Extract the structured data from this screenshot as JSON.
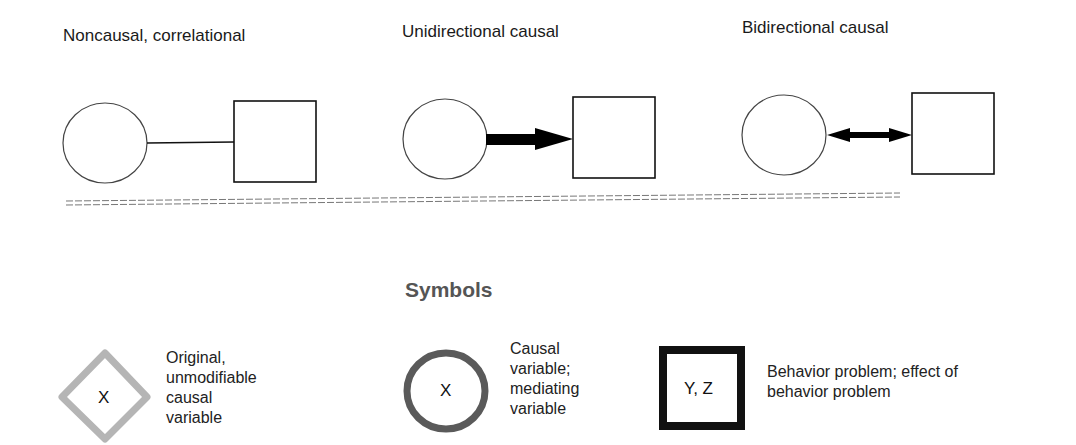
{
  "panels": [
    {
      "title": "Noncausal, correlational",
      "relation": "line"
    },
    {
      "title": "Unidirectional causal",
      "relation": "unidirectional-arrow"
    },
    {
      "title": "Bidirectional causal",
      "relation": "bidirectional-arrow"
    }
  ],
  "symbols": {
    "heading": "Symbols",
    "items": [
      {
        "shape": "diamond",
        "glyph": "X",
        "line1": "Original,",
        "line2": "unmodifiable",
        "line3": "causal",
        "line4": "variable",
        "stroke": "#b5b5b5"
      },
      {
        "shape": "circle",
        "glyph": "X",
        "line1": "Causal",
        "line2": "variable;",
        "line3": "mediating",
        "line4": "variable",
        "stroke": "#5a5a5a"
      },
      {
        "shape": "square",
        "glyph": "Y, Z",
        "line1": "Behavior problem; effect of",
        "line2": "behavior problem",
        "stroke": "#111111"
      }
    ]
  }
}
